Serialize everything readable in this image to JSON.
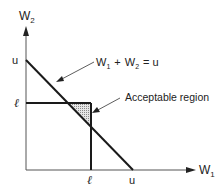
{
  "diagram": {
    "y_axis": {
      "label_main": "W",
      "label_sub": "2",
      "ticks": [
        {
          "label": "u"
        },
        {
          "label": "ℓ"
        }
      ]
    },
    "x_axis": {
      "label_main": "W",
      "label_sub": "1",
      "ticks": [
        {
          "label": "ℓ"
        },
        {
          "label": "u"
        }
      ]
    },
    "constraint_line": {
      "label_w1": "W",
      "label_w1_sub": "1",
      "label_plus": "+",
      "label_w2": "W",
      "label_w2_sub": "2",
      "label_eq": "= u"
    },
    "region": {
      "label": "Acceptable region"
    },
    "colors": {
      "line": "#1a1a1a",
      "axis": "#555555",
      "shade": "#bdbdbd"
    }
  }
}
